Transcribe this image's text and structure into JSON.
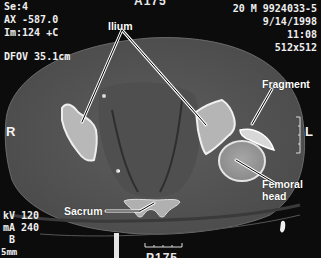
{
  "viewer": {
    "modality": "CT",
    "top_center_mark": "A175",
    "bottom_center_mark": "P175",
    "top_left": {
      "series": "Se:4",
      "position": "AX -587.0",
      "image": "Im:124 +C",
      "dfov": "DFOV 35.1cm"
    },
    "top_right": {
      "patient": "20 M 9924033-5",
      "date": "9/14/1998",
      "time": "11:08",
      "matrix": "512x512"
    },
    "bottom_left": {
      "kv": "kV 120",
      "ma": "mA 240",
      "kernel": "B",
      "thickness": "5mm"
    },
    "orientation": {
      "left_side": "R",
      "right_side": "L"
    },
    "annotations": [
      {
        "label": "Ilium"
      },
      {
        "label": "Fragment"
      },
      {
        "label": "Femoral\nhead"
      },
      {
        "label": "Sacrum"
      }
    ]
  }
}
